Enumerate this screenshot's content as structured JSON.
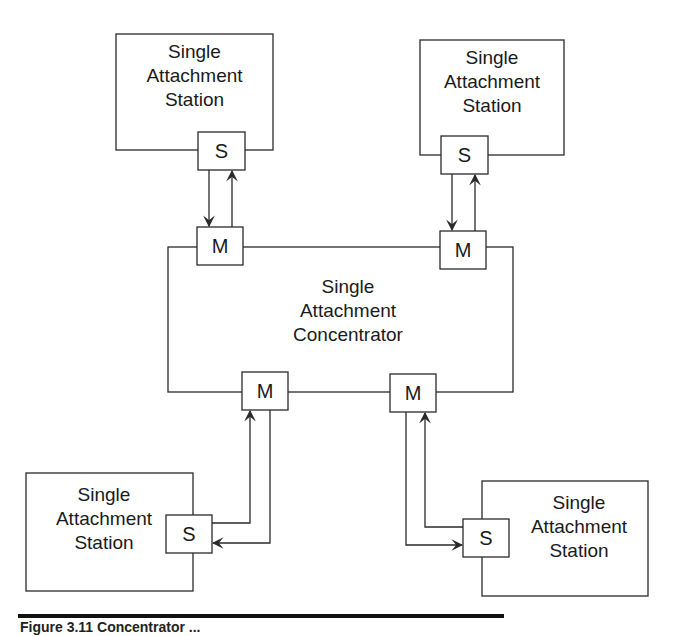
{
  "diagram": {
    "concentrator": {
      "line1": "Single",
      "line2": "Attachment",
      "line3": "Concentrator"
    },
    "stations": [
      {
        "id": "top-left",
        "line1": "Single",
        "line2": "Attachment",
        "line3": "Station",
        "port": "S"
      },
      {
        "id": "top-right",
        "line1": "Single",
        "line2": "Attachment",
        "line3": "Station",
        "port": "S"
      },
      {
        "id": "bottom-left",
        "line1": "Single",
        "line2": "Attachment",
        "line3": "Station",
        "port": "S"
      },
      {
        "id": "bottom-right",
        "line1": "Single",
        "line2": "Attachment",
        "line3": "Station",
        "port": "S"
      }
    ],
    "master_ports": [
      {
        "id": "top-left",
        "label": "M"
      },
      {
        "id": "top-right",
        "label": "M"
      },
      {
        "id": "bottom-left",
        "label": "M"
      },
      {
        "id": "bottom-right",
        "label": "M"
      }
    ],
    "colors": {
      "line": "#2a2a2a",
      "background": "#ffffff"
    }
  },
  "caption": {
    "text": "Figure 3.11   Concentrator ..."
  }
}
